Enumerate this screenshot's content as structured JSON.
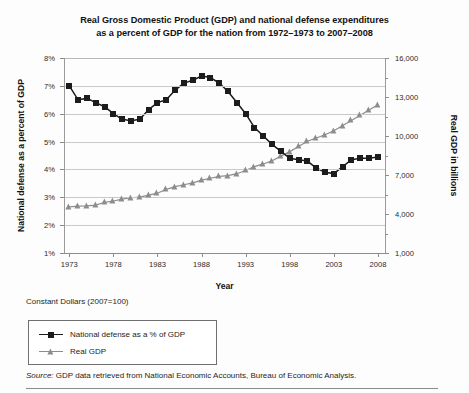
{
  "title": {
    "line1": "Real Gross Domestic Product (GDP) and national defense expenditures",
    "line2": "as a percent of GDP for the nation from 1972–1973 to 2007–2008"
  },
  "axis_titles": {
    "left": "National defense as a percent of GDP",
    "right": "Real GDP in billions",
    "x": "Year"
  },
  "notes": {
    "constant_dollars": "Constant Dollars (2007=100)",
    "source_prefix": "Source:",
    "source_text": " GDP data retrieved from National Economic Accounts, Bureau of Economic Analysis."
  },
  "legend": {
    "items": [
      {
        "label": "National defense as a % of GDP",
        "marker": "square",
        "color": "#1c1c1c"
      },
      {
        "label": "Real GDP",
        "marker": "triangle",
        "color": "#8d8d8d"
      }
    ]
  },
  "chart_data": {
    "type": "line",
    "title": "Real Gross Domestic Product (GDP) and national defense expenditures as a percent of GDP for the nation from 1972–1973 to 2007–2008",
    "xlabel": "Year",
    "grid": true,
    "legend_position": "below-left",
    "x": [
      1973,
      1974,
      1975,
      1976,
      1977,
      1978,
      1979,
      1980,
      1981,
      1982,
      1983,
      1984,
      1985,
      1986,
      1987,
      1988,
      1989,
      1990,
      1991,
      1992,
      1993,
      1994,
      1995,
      1996,
      1997,
      1998,
      1999,
      2000,
      2001,
      2002,
      2003,
      2004,
      2005,
      2006,
      2007,
      2008
    ],
    "xtick_labels": [
      "1973",
      "1978",
      "1983",
      "1988",
      "1993",
      "1998",
      "2003",
      "2008"
    ],
    "xtick_values": [
      1973,
      1978,
      1983,
      1988,
      1993,
      1998,
      2003,
      2008
    ],
    "xlim": [
      1972.4,
      2008.8
    ],
    "series": [
      {
        "name": "National defense as a % of GDP",
        "axis": "left",
        "ylabel": "National defense as a percent of GDP",
        "ylim": [
          1,
          8
        ],
        "ytick_labels": [
          "1%",
          "2%",
          "3%",
          "4%",
          "5%",
          "6%",
          "7%",
          "8%"
        ],
        "ytick_values": [
          1,
          2,
          3,
          4,
          5,
          6,
          7,
          8
        ],
        "unit": "%",
        "marker": "square",
        "color": "#1c1c1c",
        "values": [
          7.0,
          6.5,
          6.55,
          6.4,
          6.25,
          6.0,
          5.8,
          5.75,
          5.8,
          6.15,
          6.4,
          6.5,
          6.85,
          7.1,
          7.2,
          7.35,
          7.3,
          7.1,
          6.8,
          6.4,
          6.0,
          5.5,
          5.2,
          4.9,
          4.65,
          4.4,
          4.35,
          4.3,
          4.05,
          3.9,
          3.85,
          4.1,
          4.35,
          4.4,
          4.4,
          4.45
        ]
      },
      {
        "name": "Real GDP",
        "axis": "right",
        "ylabel": "Real GDP in billions",
        "ylim": [
          1000,
          16000
        ],
        "ytick_labels": [
          "1,000",
          "4,000",
          "7,000",
          "10,000",
          "13,000",
          "16,000"
        ],
        "ytick_values": [
          1000,
          4000,
          7000,
          10000,
          13000,
          16000
        ],
        "unit": "billions",
        "marker": "triangle",
        "color": "#8d8d8d",
        "values": [
          4550,
          4600,
          4620,
          4680,
          4900,
          5000,
          5150,
          5250,
          5300,
          5450,
          5600,
          5900,
          6100,
          6250,
          6400,
          6600,
          6750,
          6900,
          6950,
          7100,
          7350,
          7650,
          7850,
          8100,
          8450,
          8800,
          9200,
          9600,
          9850,
          10100,
          10400,
          10800,
          11200,
          11600,
          12000,
          12400
        ]
      }
    ]
  }
}
